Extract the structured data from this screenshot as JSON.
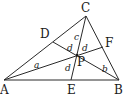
{
  "diagram": {
    "type": "geometry-triangle-cevians",
    "points": {
      "A": {
        "label": "A",
        "x": 4,
        "y": 80
      },
      "B": {
        "label": "B",
        "x": 119,
        "y": 80
      },
      "C": {
        "label": "C",
        "x": 86,
        "y": 16
      },
      "D": {
        "label": "D",
        "x": 53,
        "y": 42
      },
      "E": {
        "label": "E",
        "x": 71,
        "y": 80
      },
      "F": {
        "label": "F",
        "x": 103,
        "y": 47
      },
      "P": {
        "label": "P",
        "x": 77,
        "y": 55
      }
    },
    "segments": [
      [
        "A",
        "B"
      ],
      [
        "B",
        "C"
      ],
      [
        "C",
        "A"
      ],
      [
        "A",
        "F"
      ],
      [
        "B",
        "D"
      ],
      [
        "C",
        "E"
      ]
    ],
    "region_labels": [
      {
        "text": "a",
        "x": 34,
        "y": 68
      },
      {
        "text": "b",
        "x": 102,
        "y": 72
      },
      {
        "text": "c",
        "x": 74,
        "y": 40
      },
      {
        "text": "d",
        "x": 67,
        "y": 51
      },
      {
        "text": "d",
        "x": 82,
        "y": 51
      },
      {
        "text": "d",
        "x": 65,
        "y": 71
      }
    ],
    "colors": {
      "stroke": "#2a2a2a",
      "text": "#1a1a1a",
      "background": "#ffffff"
    }
  }
}
